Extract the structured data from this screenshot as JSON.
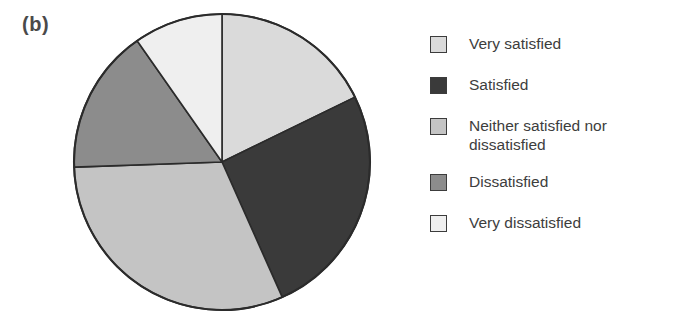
{
  "figure": {
    "panel_label": "(b)",
    "background_color": "#ffffff",
    "outline_color": "#2b2b2b"
  },
  "chart_data": {
    "type": "pie",
    "title": "",
    "xlabel": "",
    "ylabel": "",
    "legend_position": "right",
    "grid": false,
    "start_angle_deg": 0,
    "direction": "clockwise",
    "center": {
      "x": 222,
      "y": 162
    },
    "radius": 148,
    "categories": [
      "Very satisfied",
      "Satisfied",
      "Neither satisfied nor dissatisfied",
      "Dissatisfied",
      "Very dissatisfied"
    ],
    "values": [
      17.8,
      25.6,
      31.1,
      15.8,
      9.7
    ],
    "unit": "percent",
    "colors": [
      "#dadada",
      "#3a3a3a",
      "#c4c4c4",
      "#8c8c8c",
      "#efefef"
    ],
    "slices": [
      {
        "label": "Very satisfied",
        "value": 17.8,
        "color": "#dadada",
        "start_angle_deg": 0,
        "end_angle_deg": 64
      },
      {
        "label": "Satisfied",
        "value": 25.6,
        "color": "#3a3a3a",
        "start_angle_deg": 64,
        "end_angle_deg": 156
      },
      {
        "label": "Neither satisfied nor dissatisfied",
        "value": 31.1,
        "color": "#c4c4c4",
        "start_angle_deg": 156,
        "end_angle_deg": 268
      },
      {
        "label": "Dissatisfied",
        "value": 15.8,
        "color": "#8c8c8c",
        "start_angle_deg": 268,
        "end_angle_deg": 325
      },
      {
        "label": "Very dissatisfied",
        "value": 9.7,
        "color": "#efefef",
        "start_angle_deg": 325,
        "end_angle_deg": 360
      }
    ]
  },
  "legend": {
    "items": [
      {
        "label": "Very satisfied",
        "color": "#dadada"
      },
      {
        "label": "Satisfied",
        "color": "#3a3a3a"
      },
      {
        "label": "Neither satisfied nor dissatisfied",
        "color": "#c4c4c4"
      },
      {
        "label": "Dissatisfied",
        "color": "#8c8c8c"
      },
      {
        "label": "Very dissatisfied",
        "color": "#efefef"
      }
    ]
  }
}
